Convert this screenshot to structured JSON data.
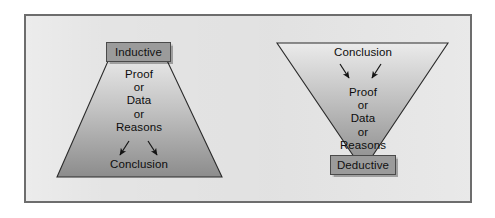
{
  "figure": {
    "panel_background": "#e4e4e4",
    "panel_border_color": "#6d6d6d",
    "shape_outline_color": "#2b2b2b",
    "shape_gradient_light": "#e9e9e9",
    "shape_gradient_dark": "#8f8f8f",
    "label_box_fill": "#9b9b9b",
    "label_box_border": "#4a4a4a",
    "text_color": "#0d0d0d",
    "arrow_color": "#141414"
  },
  "inductive": {
    "title": "Inductive",
    "shape": "trapezoid-narrow-top",
    "evidence_lines": [
      "Proof",
      "or",
      "Data",
      "or",
      "Reasons"
    ],
    "result": "Conclusion",
    "flow_direction": "evidence-down-to-conclusion",
    "arrow_count": 2
  },
  "deductive": {
    "title": "Deductive",
    "shape": "inverted-triangle",
    "premise": "Conclusion",
    "evidence_lines": [
      "Proof",
      "or",
      "Data",
      "or",
      "Reasons"
    ],
    "flow_direction": "conclusion-down-to-evidence",
    "arrow_count": 2
  }
}
